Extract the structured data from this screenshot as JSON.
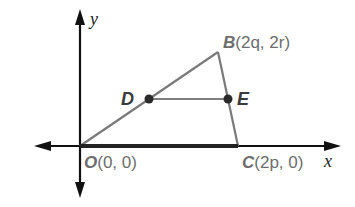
{
  "diagram": {
    "type": "coordinate-geometry",
    "axes": {
      "x_label": "x",
      "y_label": "y"
    },
    "points": {
      "O": {
        "name": "O",
        "coords": "(0, 0)"
      },
      "B": {
        "name": "B",
        "coords": "(2q, 2r)"
      },
      "C": {
        "name": "C",
        "coords": "(2p, 0)"
      },
      "D": {
        "name": "D"
      },
      "E": {
        "name": "E"
      }
    },
    "segments": [
      "OB",
      "BC",
      "OC",
      "DE"
    ],
    "colors": {
      "axis": "#111111",
      "triangle": "#7a7a7a",
      "midsegment": "#555555",
      "point": "#2a2a2a",
      "label": "#6d6d6d"
    }
  }
}
